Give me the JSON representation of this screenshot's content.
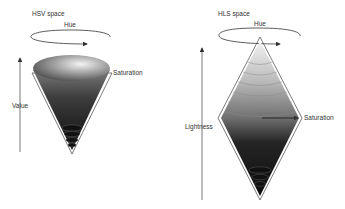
{
  "hsv": {
    "title": "HSV space",
    "hue_label": "Hue",
    "value_label": "Value",
    "saturation_label": "Saturation"
  },
  "hls": {
    "title": "HLS space",
    "hue_label": "Hue",
    "lightness_label": "Lightness",
    "saturation_label": "Saturation"
  },
  "colors": {
    "line": "#333333",
    "shade_light": "#e6e6e6",
    "shade_dark": "#141414"
  }
}
